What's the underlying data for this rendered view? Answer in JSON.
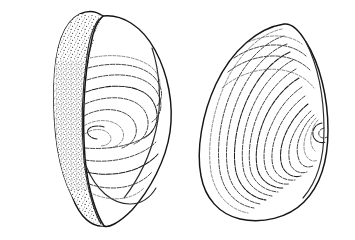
{
  "figure": {
    "medium": "ink line drawing with stipple shading",
    "background_color": "#ffffff",
    "ink_color": "#151515",
    "caption": "",
    "width_px": 355,
    "height_px": 240
  },
  "specimens": [
    {
      "id": "left-valve",
      "label": "",
      "view": "oblique anterior-interior view",
      "position": {
        "x": 55,
        "y": 14,
        "width": 120,
        "height": 212
      },
      "features": {
        "umbo_label": "",
        "umbo_position": {
          "x": 70,
          "y": 118
        },
        "lunule_label": "",
        "lunule_shading": "stipple",
        "stipple_density": "medium",
        "growth_line_count": 9,
        "growth_line_style": "dashed concentric"
      }
    },
    {
      "id": "right-valve",
      "label": "",
      "view": "lateral exterior view",
      "position": {
        "x": 196,
        "y": 22,
        "width": 130,
        "height": 200
      },
      "features": {
        "umbo_label": "",
        "umbo_position": {
          "x": 312,
          "y": 118
        },
        "lunule_label": "",
        "lunule_shading": "none",
        "growth_line_count": 14,
        "growth_line_style": "dashed concentric"
      }
    }
  ],
  "colors": {
    "paper": "#ffffff",
    "outline_ink": "#151515",
    "ridge_ink": "#3b3b3b",
    "fine_ridge_ink": "#5a5a5a",
    "stipple_ink": "#3a3a3a"
  }
}
